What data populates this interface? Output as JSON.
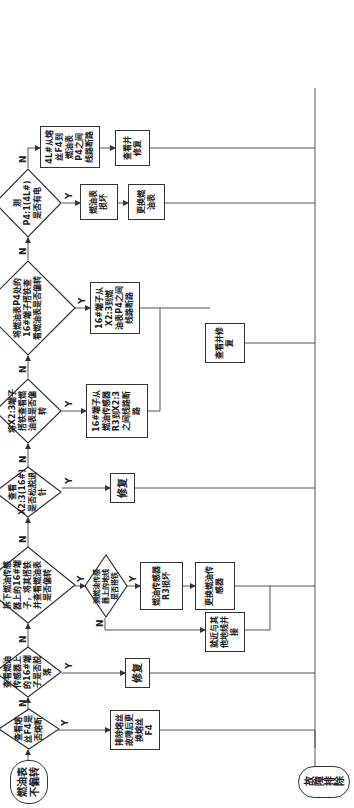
{
  "flowchart": {
    "start": "燃油表不偏转",
    "end": "故障排除",
    "decisions": [
      {
        "id": "d1",
        "text": "查看熔丝F4是否熔断"
      },
      {
        "id": "d2",
        "text": "查看燃油传感器上的16#端子是否脱落"
      },
      {
        "id": "d3",
        "text": "拆下燃油传感器上的16#端子，将其搭铁并查看燃油表是否偏转"
      },
      {
        "id": "d3a",
        "text": "测燃油传感器上的地线是否搭铁"
      },
      {
        "id": "d4",
        "text": "查看X2:3(16#)是否松脱退针"
      },
      {
        "id": "d5",
        "text": "将X2:3端子搭铁查看燃油表是否偏转"
      },
      {
        "id": "d6",
        "text": "将燃油表P4处的16#端子搭铁查看燃油表是否偏转"
      },
      {
        "id": "d7",
        "text": "测P4:1(4L#)是否有电"
      }
    ],
    "actions": [
      {
        "id": "a1",
        "text": "排除熔丝故障后更换熔丝F4"
      },
      {
        "id": "a2",
        "text": "修复"
      },
      {
        "id": "a3",
        "text": "燃油传感器R3损坏"
      },
      {
        "id": "a3b",
        "text": "更换燃油传感器"
      },
      {
        "id": "a3n",
        "text": "就近与其他地线并接"
      },
      {
        "id": "a4",
        "text": "修复"
      },
      {
        "id": "a5",
        "text": "16#端子从燃油传感器R3到X2:3之间线路断路"
      },
      {
        "id": "a6",
        "text": "16#端子从X2:3到燃油表P4之间线路断路"
      },
      {
        "id": "a56",
        "text": "查看并修复"
      },
      {
        "id": "a7y",
        "text": "燃油表损坏"
      },
      {
        "id": "a7yb",
        "text": "更换燃油表"
      },
      {
        "id": "a7n",
        "text": "4L#从熔丝F4到燃油表P4之间线路断路"
      },
      {
        "id": "a7nb",
        "text": "查看并修复"
      }
    ],
    "labels": {
      "yes": "Y",
      "no": "N"
    }
  }
}
